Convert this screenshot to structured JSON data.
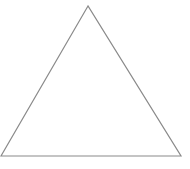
{
  "diagram": {
    "shape": "equilateral-triangle",
    "vertices": [
      [
        88,
        6
      ],
      [
        1,
        156
      ],
      [
        181,
        156
      ]
    ],
    "stroke_color": "#8a8a8a",
    "fill_color": "#ffffff",
    "stroke_width": 1.2
  }
}
